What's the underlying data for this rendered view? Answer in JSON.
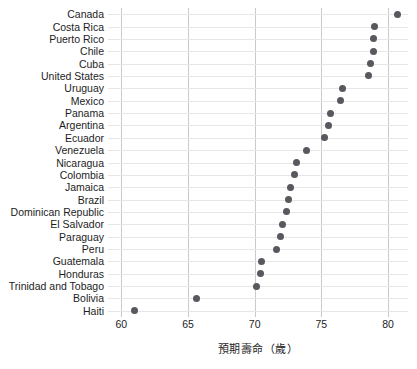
{
  "chart_data": {
    "type": "scatter",
    "title": "",
    "subtitle": "",
    "xlabel": "預期壽命（歲）",
    "ylabel": "",
    "xlim": [
      59,
      81.5
    ],
    "ylim": null,
    "grid": true,
    "legend": null,
    "legend_position": "none",
    "orientation": "horizontal",
    "marker": "circle",
    "marker_color": "#58585e",
    "gridline_color": "#c9c9c9",
    "rowline_color": "#e6e6e6",
    "xticks": [
      60,
      65,
      70,
      75,
      80
    ],
    "xtick_labels": [
      "60",
      "65",
      "70",
      "75",
      "80"
    ],
    "categories": [
      "Canada",
      "Costa Rica",
      "Puerto Rico",
      "Chile",
      "Cuba",
      "United States",
      "Uruguay",
      "Mexico",
      "Panama",
      "Argentina",
      "Ecuador",
      "Venezuela",
      "Nicaragua",
      "Colombia",
      "Jamaica",
      "Brazil",
      "Dominican Republic",
      "El Salvador",
      "Paraguay",
      "Peru",
      "Guatemala",
      "Honduras",
      "Trinidad and Tobago",
      "Bolivia",
      "Haiti"
    ],
    "values": [
      80.7,
      79.0,
      78.9,
      78.9,
      78.7,
      78.5,
      76.6,
      76.4,
      75.7,
      75.5,
      75.2,
      73.9,
      73.1,
      73.0,
      72.7,
      72.5,
      72.4,
      72.1,
      71.9,
      71.6,
      70.5,
      70.4,
      70.1,
      65.6,
      61.0
    ]
  }
}
